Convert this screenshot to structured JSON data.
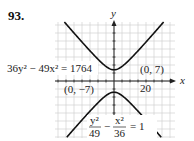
{
  "problem": {
    "number": "93."
  },
  "chart_data": {
    "type": "line",
    "title": "",
    "xlabel": "x",
    "ylabel": "y",
    "xlim": [
      -37,
      38
    ],
    "ylim": [
      -36,
      37
    ],
    "grid": true,
    "grid_step": 5,
    "x_tick_labels": [
      {
        "value": 20,
        "label": "20"
      }
    ],
    "series": [
      {
        "name": "upper branch",
        "equation": "y = 7*sqrt(1 + x^2/36)",
        "branch": "upper"
      },
      {
        "name": "lower branch",
        "equation": "y = -7*sqrt(1 + x^2/36)",
        "branch": "lower"
      }
    ],
    "points": [
      {
        "label": "(0, 7)",
        "x": 0,
        "y": 7
      },
      {
        "label": "(0, −7)",
        "x": 0,
        "y": -7
      }
    ],
    "annotations": {
      "equation_general": "36y² − 49x² = 1764",
      "equation_standard_left": "y²/49",
      "equation_standard_minus": "−",
      "equation_standard_right": "x²/36",
      "equation_standard_eq": "= 1"
    }
  }
}
